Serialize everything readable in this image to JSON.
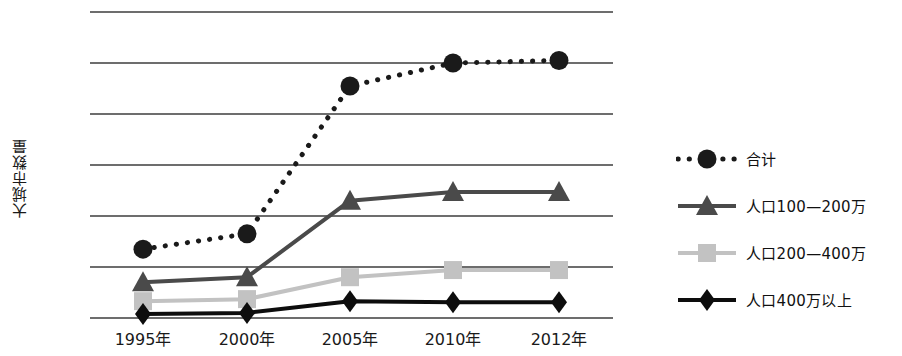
{
  "chart_data": {
    "type": "line",
    "title": "",
    "xlabel": "",
    "ylabel": "大城市数量",
    "categories": [
      "1995年",
      "2000年",
      "2005年",
      "2010年",
      "2012年"
    ],
    "ylim": [
      0,
      6
    ],
    "y_gridlines": [
      0,
      1,
      2,
      3,
      4,
      5,
      6
    ],
    "y_tick_labels_shown": false,
    "grid": true,
    "legend_position": "right",
    "series": [
      {
        "name": "合计",
        "marker": "circle",
        "line_style": "dotted",
        "color": "#1a1a1a",
        "values": [
          1.35,
          1.65,
          4.55,
          5.0,
          5.05
        ]
      },
      {
        "name": "人口100—200万",
        "marker": "triangle",
        "line_style": "solid",
        "color": "#4a4a4a",
        "values": [
          0.7,
          0.8,
          2.3,
          2.47,
          2.47
        ]
      },
      {
        "name": "人口200—400万",
        "marker": "square",
        "line_style": "solid",
        "color": "#c2c2c2",
        "values": [
          0.33,
          0.37,
          0.8,
          0.94,
          0.94
        ]
      },
      {
        "name": "人口400万以上",
        "marker": "diamond",
        "line_style": "solid",
        "color": "#0d0d0d",
        "values": [
          0.08,
          0.1,
          0.33,
          0.31,
          0.31
        ]
      }
    ]
  },
  "legend": {
    "items": [
      {
        "label": "合计",
        "marker": "circle-marker-icon",
        "color": "#1a1a1a",
        "dashed": true
      },
      {
        "label": "人口100—200万",
        "marker": "triangle-marker-icon",
        "color": "#4a4a4a",
        "dashed": false
      },
      {
        "label": "人口200—400万",
        "marker": "square-marker-icon",
        "color": "#c2c2c2",
        "dashed": false
      },
      {
        "label": "人口400万以上",
        "marker": "diamond-marker-icon",
        "color": "#0d0d0d",
        "dashed": false
      }
    ]
  },
  "axis": {
    "y_title": "大城市数量",
    "x_tick_labels": [
      "1995年",
      "2000年",
      "2005年",
      "2010年",
      "2012年"
    ]
  },
  "colors": {
    "gridline": "#3c3c3c",
    "total_series": "#1a1a1a",
    "pop_100_200": "#4a4a4a",
    "pop_200_400": "#c2c2c2",
    "pop_400_plus": "#0d0d0d",
    "text": "#111111",
    "background": "#ffffff"
  }
}
